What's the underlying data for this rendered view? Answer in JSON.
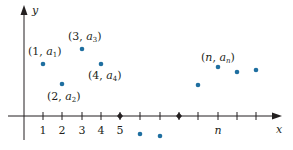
{
  "diagram": {
    "axes": {
      "x_label": "x",
      "y_label": "y",
      "x_tick_labels": [
        "1",
        "2",
        "3",
        "4",
        "5",
        "n"
      ]
    },
    "point_labels": {
      "p1": {
        "pre": "(1, ",
        "var": "a",
        "sub": "1",
        "post": ")"
      },
      "p2": {
        "pre": "(2, ",
        "var": "a",
        "sub": "2",
        "post": ")"
      },
      "p3": {
        "pre": "(3, ",
        "var": "a",
        "sub": "3",
        "post": ")"
      },
      "p4": {
        "pre": "(4, ",
        "var": "a",
        "sub": "4",
        "post": ")"
      },
      "pn": {
        "pre": "(",
        "nvar": "n",
        "mid": ", ",
        "var": "a",
        "sub": "n",
        "post": ")"
      }
    },
    "colors": {
      "point": "#1f6fa0",
      "axis": "#231f20"
    }
  }
}
